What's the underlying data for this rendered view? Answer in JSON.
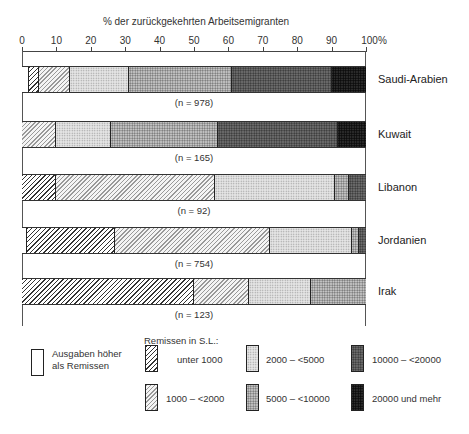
{
  "chart_data": {
    "type": "bar",
    "orientation": "horizontal-stacked-100",
    "title": "% der zurückgekehrten Arbeitsemigranten",
    "xlabel": "% der zurückgekehrten Arbeitsemigranten",
    "ylabel": "",
    "xlim": [
      0,
      100
    ],
    "x_ticks": [
      "0",
      "10",
      "20",
      "30",
      "40",
      "50",
      "60",
      "70",
      "80",
      "90",
      "100%"
    ],
    "grid": false,
    "legend_position": "bottom",
    "legend_title": "Remissen in S.L.:",
    "categories_legend": [
      {
        "key": "none",
        "label": "Ausgaben höher als Remissen",
        "pattern": "p-none"
      },
      {
        "key": "u1000",
        "label": "unter 1000",
        "pattern": "p-h1"
      },
      {
        "key": "1000_2000",
        "label": "1000 – <2000",
        "pattern": "p-h2"
      },
      {
        "key": "2000_5000",
        "label": "2000 – <5000",
        "pattern": "p-d1"
      },
      {
        "key": "5000_10000",
        "label": "5000 – <10000",
        "pattern": "p-d2"
      },
      {
        "key": "10000_20000",
        "label": "10000 – <20000",
        "pattern": "p-d3"
      },
      {
        "key": "20000plus",
        "label": "20000 und mehr",
        "pattern": "p-d4"
      }
    ],
    "series_order": [
      "Ausgaben höher als Remissen",
      "unter 1000",
      "1000 – <2000",
      "2000 – <5000",
      "5000 – <10000",
      "10000 – <20000",
      "20000 und mehr"
    ],
    "categories": [
      "Saudi-Arabien",
      "Kuwait",
      "Libanon",
      "Jordanien",
      "Irak"
    ],
    "series": [
      {
        "name": "Ausgaben höher als Remissen",
        "values": [
          2,
          0,
          0,
          1.5,
          0
        ]
      },
      {
        "name": "unter 1000",
        "values": [
          3,
          0,
          10,
          25.5,
          50
        ]
      },
      {
        "name": "1000 – <2000",
        "values": [
          9,
          10,
          46,
          45,
          16
        ]
      },
      {
        "name": "2000 – <5000",
        "values": [
          17,
          16,
          35,
          24,
          18
        ]
      },
      {
        "name": "5000 – <10000",
        "values": [
          30,
          31,
          4,
          2,
          16
        ]
      },
      {
        "name": "10000 – <20000",
        "values": [
          29,
          35,
          5,
          2,
          0
        ]
      },
      {
        "name": "20000 und mehr",
        "values": [
          10,
          8,
          0,
          0,
          0
        ]
      }
    ],
    "sample_sizes": [
      "(n = 978)",
      "(n = 165)",
      "(n = 92)",
      "(n = 754)",
      "(n = 123)"
    ]
  },
  "axis": {
    "title": "% der zurückgekehrten Arbeitsemigranten",
    "ticks": [
      {
        "label": "0",
        "pct": 0
      },
      {
        "label": "10",
        "pct": 10
      },
      {
        "label": "20",
        "pct": 20
      },
      {
        "label": "30",
        "pct": 30
      },
      {
        "label": "40",
        "pct": 40
      },
      {
        "label": "50",
        "pct": 50
      },
      {
        "label": "60",
        "pct": 60
      },
      {
        "label": "70",
        "pct": 70
      },
      {
        "label": "80",
        "pct": 80
      },
      {
        "label": "90",
        "pct": 90
      },
      {
        "label": "100%",
        "pct": 100
      }
    ]
  },
  "rows": [
    {
      "label": "Saudi-Arabien",
      "n": "(n = 978)"
    },
    {
      "label": "Kuwait",
      "n": "(n = 165)"
    },
    {
      "label": "Libanon",
      "n": "(n = 92)"
    },
    {
      "label": "Jordanien",
      "n": "(n = 754)"
    },
    {
      "label": "Irak",
      "n": "(n = 123)"
    }
  ],
  "legend": {
    "title": "Remissen in S.L.:",
    "expenses_line1": "Ausgaben höher",
    "expenses_line2": "als Remissen",
    "items": [
      {
        "label": "unter 1000"
      },
      {
        "label": "1000 – <2000"
      },
      {
        "label": "2000 – <5000"
      },
      {
        "label": "5000 – <10000"
      },
      {
        "label": "10000 – <20000"
      },
      {
        "label": "20000 und mehr"
      }
    ]
  }
}
